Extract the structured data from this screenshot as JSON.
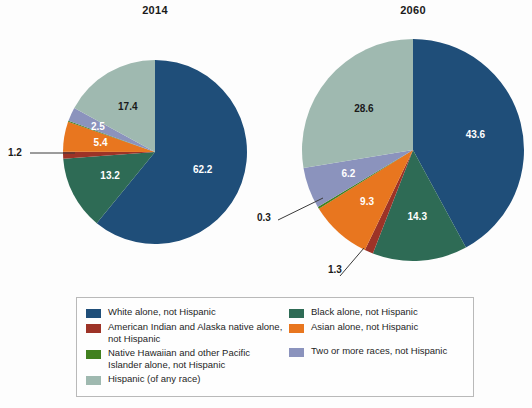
{
  "chart_data": {
    "type": "pie",
    "title": "",
    "legend_position": "bottom",
    "charts": [
      {
        "title": "2014",
        "categories": [
          "White alone, not Hispanic",
          "Black alone, not Hispanic",
          "American Indian and Alaska native alone, not Hispanic",
          "Asian alone, not Hispanic",
          "Native Hawaiian and other Pacific Islander alone, not Hispanic",
          "Two or more races, not Hispanic",
          "Hispanic (of any race)"
        ],
        "values": [
          62.2,
          13.2,
          1.2,
          5.4,
          0.2,
          2.5,
          17.4
        ],
        "labels": [
          "62.2",
          "13.2",
          "1.2",
          "5.4",
          "",
          "2.5",
          "17.4"
        ]
      },
      {
        "title": "2060",
        "categories": [
          "White alone, not Hispanic",
          "Black alone, not Hispanic",
          "American Indian and Alaska native alone, not Hispanic",
          "Asian alone, not Hispanic",
          "Native Hawaiian and other Pacific Islander alone, not Hispanic",
          "Two or more races, not Hispanic",
          "Hispanic (of any race)"
        ],
        "values": [
          43.6,
          14.3,
          1.3,
          9.3,
          0.3,
          6.2,
          28.6
        ],
        "labels": [
          "43.6",
          "14.3",
          "1.3",
          "9.3",
          "0.3",
          "6.2",
          "28.6"
        ]
      }
    ]
  },
  "titles": {
    "left": "2014",
    "right": "2060"
  },
  "pie_left": {
    "white": "62.2",
    "black": "13.2",
    "amind": "1.2",
    "asian": "5.4",
    "two_or_more": "2.5",
    "hispanic": "17.4"
  },
  "pie_right": {
    "white": "43.6",
    "black": "14.3",
    "amind": "1.3",
    "asian": "9.3",
    "nhpi": "0.3",
    "two_or_more": "6.2",
    "hispanic": "28.6"
  },
  "legend": {
    "left_column": [
      {
        "label": "White alone, not Hispanic",
        "color": "#1f4e79"
      },
      {
        "label": "American Indian and Alaska native alone, not Hispanic",
        "color": "#9d3327"
      },
      {
        "label": "Native Hawaiian and other Pacific Islander alone, not Hispanic",
        "color": "#41801f"
      },
      {
        "label": "Hispanic (of any race)",
        "color": "#9fb9b0"
      }
    ],
    "right_column": [
      {
        "label": "Black alone, not Hispanic",
        "color": "#2e6b55"
      },
      {
        "label": "Asian alone, not Hispanic",
        "color": "#e8761f"
      },
      {
        "label": "Two or more races, not Hispanic",
        "color": "#8b93bd"
      }
    ]
  },
  "colors": {
    "white_nh": "#1f4e79",
    "black_nh": "#2e6b55",
    "amind_nh": "#9d3327",
    "asian_nh": "#e8761f",
    "nhpi_nh": "#41801f",
    "two_or_more_nh": "#8b93bd",
    "hispanic": "#9fb9b0"
  }
}
